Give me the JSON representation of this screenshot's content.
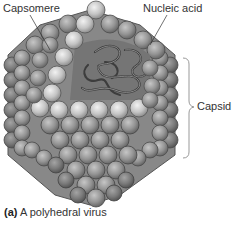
{
  "figure": {
    "labels": {
      "capsomere": "Capsomere",
      "nucleic_acid": "Nucleic acid",
      "capsid": "Capsid"
    },
    "caption": {
      "letter": "(a)",
      "text": "A polyhedral virus"
    },
    "colors": {
      "sphere_light": "#c8c8c8",
      "sphere_mid": "#9a9a9a",
      "sphere_dark": "#6e6e6e",
      "interior": "#7a7a7a",
      "nucleic_acid": "#4a4a4a",
      "bracket": "#999999"
    }
  }
}
